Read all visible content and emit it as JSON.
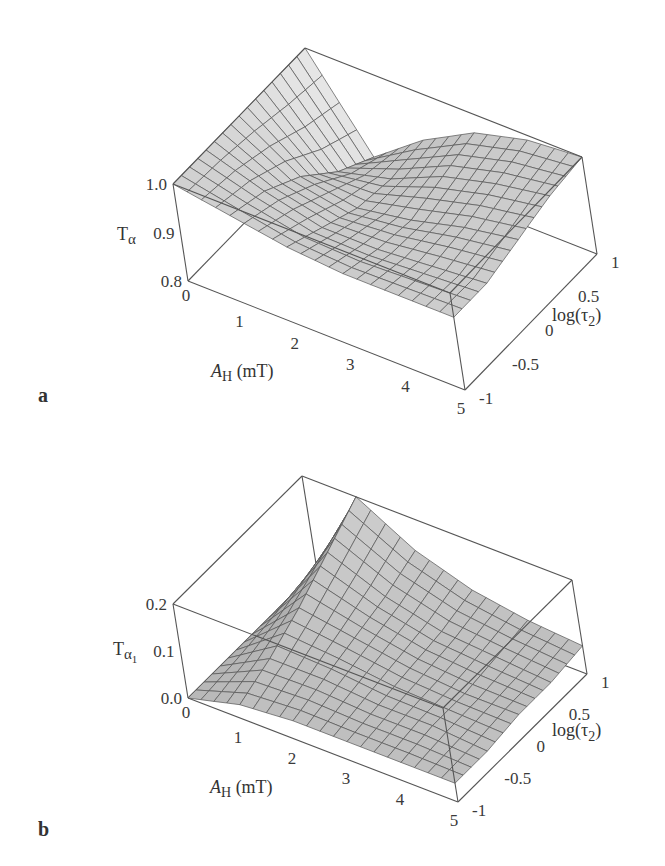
{
  "chart_data": [
    {
      "type": "surface",
      "panel_label": "a",
      "title": "",
      "zlabel_main": "T",
      "zlabel_sub": "α",
      "xlabel_main": "A",
      "xlabel_sub": "H",
      "xlabel_unit": " (mT)",
      "ylabel": "log(τ2)",
      "ylabel_main": "log(τ",
      "ylabel_sub": "2",
      "ylabel_close": ")",
      "xlim": [
        0,
        5
      ],
      "ylim": [
        -1,
        1
      ],
      "zlim": [
        0.8,
        1.0
      ],
      "x_ticks": [
        "0",
        "1",
        "2",
        "3",
        "4",
        "5"
      ],
      "y_ticks": [
        "-1",
        "-0.5",
        "0",
        "0.5",
        "1"
      ],
      "z_ticks": [
        "0.8",
        "0.9",
        "1.0"
      ],
      "surface_description": "T_alpha equals 1.0 at A_H = 0 for all log(tau2); drops steeply toward ~0.8 at small A_H for large log(tau2) and flattens to a plateau near 0.95-1.0 at large A_H; deepest trough near A_H ~ 1-2.",
      "grid_points": {
        "x": [
          0,
          1,
          2,
          3,
          4,
          5
        ],
        "y": [
          -1,
          -0.5,
          0,
          0.5,
          1
        ],
        "z": [
          [
            1.0,
            0.98,
            0.96,
            0.95,
            0.95,
            0.95
          ],
          [
            1.0,
            0.96,
            0.93,
            0.93,
            0.94,
            0.95
          ],
          [
            1.0,
            0.92,
            0.9,
            0.92,
            0.95,
            0.97
          ],
          [
            1.0,
            0.86,
            0.89,
            0.94,
            0.97,
            0.99
          ],
          [
            1.0,
            0.82,
            0.9,
            0.96,
            0.99,
            1.0
          ]
        ]
      }
    },
    {
      "type": "surface",
      "panel_label": "b",
      "title": "",
      "zlabel_main": "T",
      "zlabel_sub": "α",
      "zlabel_subsub": "1",
      "xlabel_main": "A",
      "xlabel_sub": "H",
      "xlabel_unit": " (mT)",
      "ylabel": "log(τ2)",
      "ylabel_main": "log(τ",
      "ylabel_sub": "2",
      "ylabel_close": ")",
      "xlim": [
        0,
        5
      ],
      "ylim": [
        -1,
        1
      ],
      "zlim": [
        0.0,
        0.2
      ],
      "x_ticks": [
        "0",
        "1",
        "2",
        "3",
        "4",
        "5"
      ],
      "y_ticks": [
        "-1",
        "-0.5",
        "0",
        "0.5",
        "1"
      ],
      "z_ticks": [
        "0.0",
        "0.1",
        "0.2"
      ],
      "surface_description": "T_alpha1 is 0 at A_H = 0; sharp peak (~0.2) at small A_H (~0.5-1 mT) and large log(tau2) (~1); decays toward ~0.05 at large A_H.",
      "grid_points": {
        "x": [
          0,
          1,
          2,
          3,
          4,
          5
        ],
        "y": [
          -1,
          -0.5,
          0,
          0.5,
          1
        ],
        "z": [
          [
            0.0,
            0.03,
            0.04,
            0.04,
            0.04,
            0.04
          ],
          [
            0.0,
            0.06,
            0.06,
            0.05,
            0.05,
            0.04
          ],
          [
            0.0,
            0.1,
            0.08,
            0.06,
            0.05,
            0.05
          ],
          [
            0.0,
            0.15,
            0.1,
            0.07,
            0.06,
            0.05
          ],
          [
            0.0,
            0.2,
            0.13,
            0.09,
            0.07,
            0.06
          ]
        ]
      }
    }
  ]
}
